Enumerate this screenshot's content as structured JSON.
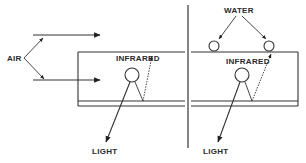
{
  "diagram": {
    "left_panel": {
      "air_label": "AIR",
      "infrared_label": "INFRARED",
      "light_label": "LIGHT"
    },
    "right_panel": {
      "water_label": "WATER",
      "infrared_label": "INFRARED",
      "light_label": "LIGHT"
    },
    "colors": {
      "line": "#333333",
      "text": "#2a2a2a",
      "background": "#ffffff"
    }
  }
}
